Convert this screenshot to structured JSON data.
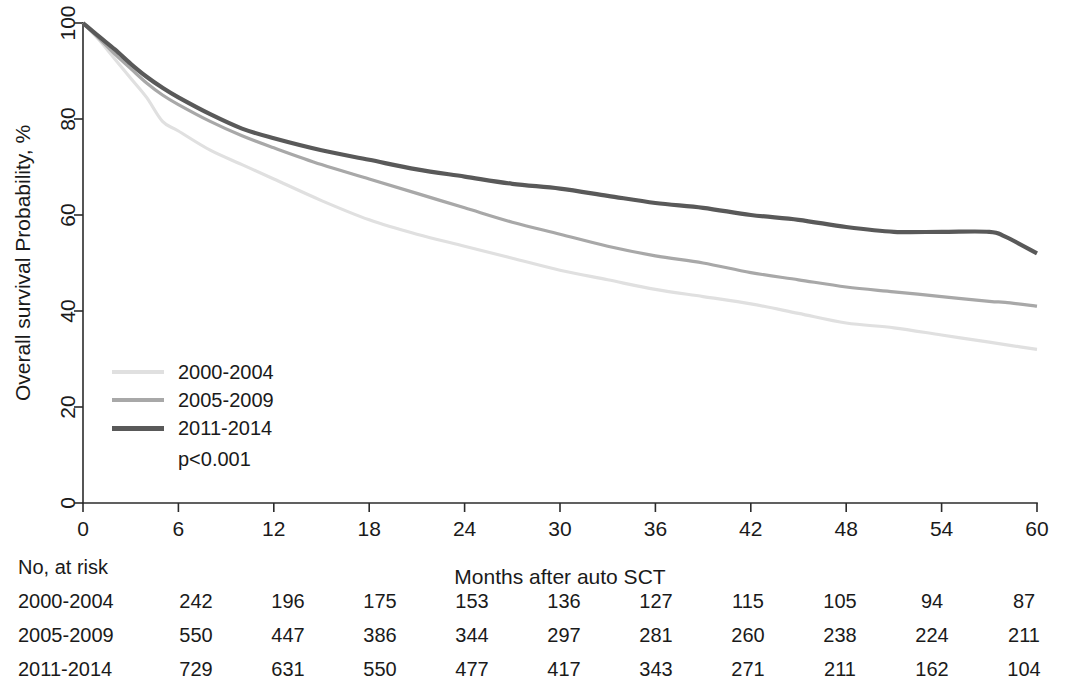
{
  "chart_data": {
    "type": "line",
    "title": "",
    "xlabel": "Months after auto SCT",
    "ylabel": "Overall survival Probability, %",
    "xlim": [
      0,
      60
    ],
    "ylim": [
      0,
      100
    ],
    "xticks": [
      0,
      6,
      12,
      18,
      24,
      30,
      36,
      42,
      48,
      54,
      60
    ],
    "yticks": [
      0,
      20,
      40,
      60,
      80,
      100
    ],
    "grid": false,
    "legend_position": "inside-left",
    "annotation": "p<0.001",
    "x": [
      0,
      1,
      2,
      3,
      4,
      5,
      6,
      8,
      10,
      12,
      15,
      18,
      21,
      24,
      27,
      30,
      33,
      36,
      39,
      42,
      45,
      48,
      51,
      54,
      57,
      58,
      60
    ],
    "series": [
      {
        "name": "2000-2004",
        "color": "#e0e0e0",
        "values": [
          100,
          96.5,
          92.5,
          88.5,
          84.5,
          79.5,
          77.5,
          73.5,
          70.5,
          67.5,
          63.0,
          59.0,
          56.0,
          53.5,
          51.0,
          48.5,
          46.5,
          44.5,
          43.0,
          41.5,
          39.5,
          37.5,
          36.5,
          35.0,
          33.5,
          33.0,
          32.0
        ]
      },
      {
        "name": "2005-2009",
        "color": "#a8a8a8",
        "values": [
          100,
          96.8,
          93.5,
          90.5,
          87.5,
          85.0,
          83.0,
          79.5,
          76.5,
          74.0,
          70.5,
          67.5,
          64.5,
          61.5,
          58.5,
          56.0,
          53.5,
          51.5,
          50.0,
          48.0,
          46.5,
          45.0,
          44.0,
          43.0,
          42.0,
          41.8,
          41.0
        ]
      },
      {
        "name": "2011-2014",
        "color": "#595959",
        "values": [
          100,
          97.2,
          94.5,
          91.5,
          88.8,
          86.5,
          84.5,
          81.0,
          78.0,
          76.0,
          73.5,
          71.5,
          69.5,
          68.0,
          66.5,
          65.5,
          64.0,
          62.5,
          61.5,
          60.0,
          59.0,
          57.5,
          56.5,
          56.5,
          56.5,
          55.5,
          52.0
        ]
      }
    ],
    "risk_table": {
      "title": "No, at risk",
      "times": [
        0,
        6,
        12,
        18,
        24,
        30,
        36,
        42,
        48,
        54,
        60
      ],
      "rows": [
        {
          "group": "2000-2004",
          "counts": [
            242,
            196,
            175,
            153,
            136,
            127,
            115,
            105,
            94,
            87
          ]
        },
        {
          "group": "2005-2009",
          "counts": [
            550,
            447,
            386,
            344,
            297,
            281,
            260,
            238,
            224,
            211
          ]
        },
        {
          "group": "2011-2014",
          "counts": [
            729,
            631,
            550,
            477,
            417,
            343,
            271,
            211,
            162,
            104
          ]
        }
      ]
    }
  },
  "legend": {
    "items": [
      {
        "label": "2000-2004"
      },
      {
        "label": "2005-2009"
      },
      {
        "label": "2011-2014"
      }
    ],
    "pvalue": "p<0.001"
  },
  "axes": {
    "ylabel": "Overall survival Probability, %",
    "xlabel": "Months after auto SCT",
    "yticks": [
      "0",
      "20",
      "40",
      "60",
      "80",
      "100"
    ],
    "xticks": [
      "0",
      "6",
      "12",
      "18",
      "24",
      "30",
      "36",
      "42",
      "48",
      "54",
      "60"
    ]
  },
  "risk": {
    "title": "No, at risk"
  }
}
